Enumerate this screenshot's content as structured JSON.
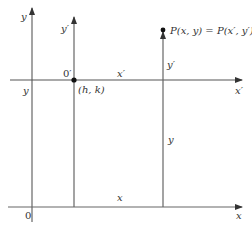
{
  "diagram": {
    "type": "coordinate-translation",
    "labels": {
      "y_axis_top": "y",
      "y_prime_axis_top": "y′",
      "origin_prime": "0′",
      "hk_point": "(h, k)",
      "x_prime_segment": "x′",
      "y_left_segment": "y",
      "x_prime_axis_end": "x′",
      "point_p": "P(x, y) = P(x′, y′)",
      "y_prime_segment": "y′",
      "y_segment": "y",
      "x_segment": "x",
      "origin": "0",
      "x_axis_end": "x"
    },
    "colors": {
      "line": "#555555",
      "text": "#333333",
      "point": "#111111"
    }
  }
}
